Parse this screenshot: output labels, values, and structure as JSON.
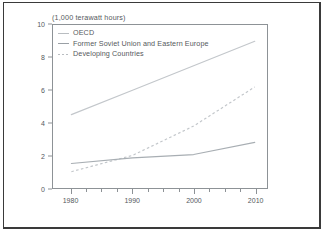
{
  "figure": {
    "title": "(1,000 terawatt hours)"
  },
  "legend": {
    "position": "top-left-inside",
    "items": [
      {
        "label": "OECD",
        "style": "solid",
        "swatch": "legend-swatch-oecd"
      },
      {
        "label": "Former Soviet Union and Eastern Europe",
        "style": "solid",
        "swatch": "legend-swatch-fsu"
      },
      {
        "label": "Developing Countries",
        "style": "dashed",
        "swatch": "legend-swatch-developing"
      }
    ]
  },
  "axes": {
    "y_ticks": [
      "10",
      "8",
      "6",
      "4",
      "2",
      "0"
    ],
    "x_ticks": [
      "1980",
      "1990",
      "2000",
      "2010"
    ]
  },
  "colors": {
    "line_oecd": "#c3c7cb",
    "line_fsu": "#a8aeb3",
    "line_developing": "#c3c7cb",
    "axis": "#8d9296",
    "text": "#55595d",
    "frame": "#3a3a3a",
    "background": "#ffffff"
  },
  "chart_data": {
    "type": "line",
    "title": "(1,000 terawatt hours)",
    "xlabel": "",
    "ylabel": "1,000 terawatt hours",
    "xlim": [
      1977,
      2012
    ],
    "ylim": [
      0,
      10
    ],
    "y_ticks": [
      0,
      2,
      4,
      6,
      8,
      10
    ],
    "x_ticks": [
      1980,
      1990,
      2000,
      2010
    ],
    "x_minor_tick_interval": 2.5,
    "grid": false,
    "legend_position": "upper left",
    "series": [
      {
        "name": "OECD",
        "style": "solid",
        "color": "#c3c7cb",
        "x": [
          1980,
          1990,
          2000,
          2010
        ],
        "values": [
          4.5,
          6.0,
          7.5,
          9.0
        ]
      },
      {
        "name": "Former Soviet Union and Eastern Europe",
        "style": "solid",
        "color": "#a8aeb3",
        "x": [
          1980,
          1990,
          2000,
          2010
        ],
        "values": [
          1.5,
          1.85,
          2.05,
          2.8
        ]
      },
      {
        "name": "Developing Countries",
        "style": "dashed",
        "color": "#c3c7cb",
        "x": [
          1980,
          1990,
          2000,
          2010
        ],
        "values": [
          1.0,
          2.0,
          3.8,
          6.2
        ]
      }
    ]
  }
}
